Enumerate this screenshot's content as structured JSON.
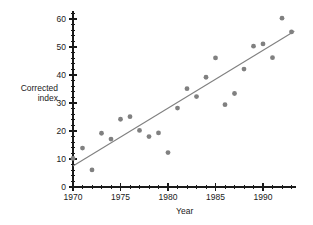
{
  "chart_data": {
    "type": "scatter",
    "title": "",
    "xlabel": "Year",
    "ylabel": "Corrected index",
    "ylabel_lines": [
      "Corrected",
      "index"
    ],
    "xlim": [
      1970,
      1993.5
    ],
    "ylim": [
      0,
      63
    ],
    "x_major_ticks": [
      1970,
      1975,
      1980,
      1985,
      1990
    ],
    "x_major_tick_labels": [
      "1970",
      "1975",
      "1980",
      "1985",
      "1990"
    ],
    "x_minor_tick_step": 1,
    "y_major_ticks": [
      0,
      10,
      20,
      30,
      40,
      50,
      60
    ],
    "y_major_tick_labels": [
      "0",
      "10",
      "20",
      "30",
      "40",
      "50",
      "60"
    ],
    "y_minor_tick_step": 2,
    "grid": false,
    "legend": false,
    "point_color": "#808080",
    "line_color": "#808080",
    "axis_color": "#1a1a1a",
    "series": [
      {
        "name": "Corrected index",
        "marker": "circle",
        "points": [
          {
            "x": 1970,
            "y": 10.2
          },
          {
            "x": 1971,
            "y": 13.9
          },
          {
            "x": 1972,
            "y": 6.1
          },
          {
            "x": 1973,
            "y": 19.2
          },
          {
            "x": 1974,
            "y": 17.1
          },
          {
            "x": 1975,
            "y": 24.2
          },
          {
            "x": 1976,
            "y": 25.1
          },
          {
            "x": 1977,
            "y": 20.2
          },
          {
            "x": 1978,
            "y": 18.0
          },
          {
            "x": 1979,
            "y": 19.3
          },
          {
            "x": 1980,
            "y": 12.3
          },
          {
            "x": 1981,
            "y": 28.2
          },
          {
            "x": 1982,
            "y": 35.1
          },
          {
            "x": 1983,
            "y": 32.3
          },
          {
            "x": 1984,
            "y": 39.2
          },
          {
            "x": 1985,
            "y": 46.1
          },
          {
            "x": 1986,
            "y": 29.4
          },
          {
            "x": 1987,
            "y": 33.4
          },
          {
            "x": 1988,
            "y": 42.1
          },
          {
            "x": 1989,
            "y": 50.3
          },
          {
            "x": 1990,
            "y": 51.1
          },
          {
            "x": 1991,
            "y": 46.2
          },
          {
            "x": 1992,
            "y": 60.3
          },
          {
            "x": 1993,
            "y": 55.4
          }
        ]
      }
    ],
    "trend_line": {
      "name": "least-squares fit",
      "x_start": 1970,
      "y_start": 7.5,
      "x_end": 1993.3,
      "y_end": 55.6
    }
  }
}
